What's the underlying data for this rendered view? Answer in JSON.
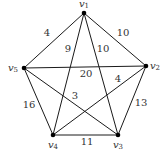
{
  "graph": {
    "nodes": [
      {
        "id": "v1",
        "name": "v",
        "sub": "1",
        "x": 84,
        "y": 13,
        "lx": 84,
        "ly": 4
      },
      {
        "id": "v2",
        "name": "v",
        "sub": "2",
        "x": 146,
        "y": 66,
        "lx": 155,
        "ly": 66
      },
      {
        "id": "v3",
        "name": "v",
        "sub": "3",
        "x": 118,
        "y": 135,
        "lx": 118,
        "ly": 145
      },
      {
        "id": "v4",
        "name": "v",
        "sub": "4",
        "x": 53,
        "y": 135,
        "lx": 53,
        "ly": 145
      },
      {
        "id": "v5",
        "name": "v",
        "sub": "5",
        "x": 24,
        "y": 68,
        "lx": 13,
        "ly": 68
      }
    ],
    "edges": [
      {
        "from": "v1",
        "to": "v5",
        "weight": "4",
        "lx": 47,
        "ly": 33
      },
      {
        "from": "v1",
        "to": "v4",
        "weight": "9",
        "lx": 68,
        "ly": 49
      },
      {
        "from": "v1",
        "to": "v3",
        "weight": "10",
        "lx": 103,
        "ly": 49
      },
      {
        "from": "v1",
        "to": "v2",
        "weight": "10",
        "lx": 123,
        "ly": 33
      },
      {
        "from": "v5",
        "to": "v2",
        "weight": "20",
        "lx": 86,
        "ly": 74
      },
      {
        "from": "v2",
        "to": "v4",
        "weight": "4",
        "lx": 118,
        "ly": 79
      },
      {
        "from": "v5",
        "to": "v3",
        "weight": "3",
        "lx": 75,
        "ly": 96
      },
      {
        "from": "v5",
        "to": "v4",
        "weight": "16",
        "lx": 29,
        "ly": 105
      },
      {
        "from": "v2",
        "to": "v3",
        "weight": "13",
        "lx": 141,
        "ly": 103
      },
      {
        "from": "v4",
        "to": "v3",
        "weight": "11",
        "lx": 87,
        "ly": 142
      }
    ]
  }
}
